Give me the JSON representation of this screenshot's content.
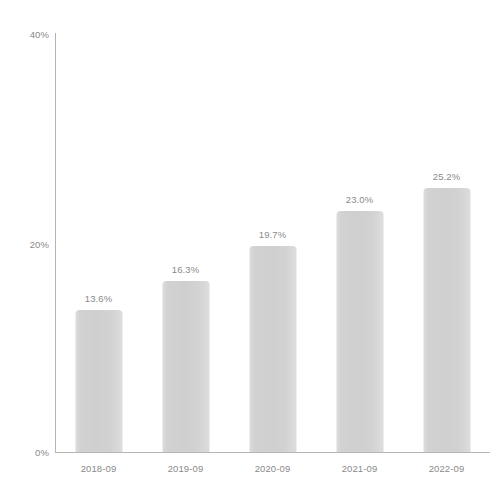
{
  "chart_data": {
    "type": "bar",
    "title": "",
    "subtitle": "",
    "xlabel": "",
    "ylabel": "",
    "categories": [
      "2018-09",
      "2019-09",
      "2020-09",
      "2021-09",
      "2022-09"
    ],
    "values": [
      13.6,
      16.3,
      19.7,
      23.0,
      25.2
    ],
    "data_labels": [
      "13.6%",
      "16.3%",
      "19.7%",
      "23.0%",
      "25.2%"
    ],
    "ylim": [
      0,
      40
    ],
    "y_ticks": [
      0,
      20,
      40
    ],
    "y_tick_labels": [
      "0%",
      "20%",
      "40%"
    ],
    "grid": false,
    "legend": null,
    "legend_position": "none",
    "bar_color": "#d3d3d3",
    "axis_color": "#b5b5b5",
    "text_color": "#8a8a8a",
    "background_color": "#ffffff"
  }
}
